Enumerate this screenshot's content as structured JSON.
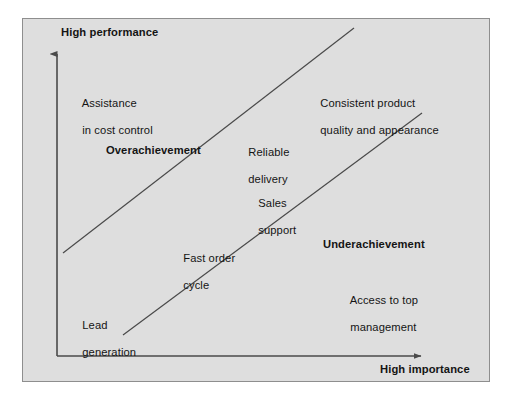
{
  "figure": {
    "type": "importance-performance-matrix",
    "background_color": "#dedede",
    "border_color": "#8e8e8e",
    "page_background": "#ffffff",
    "line_color": "#4a4a4a",
    "text_color": "#141414"
  },
  "axes": {
    "y_axis": {
      "title": "High performance",
      "direction": "up",
      "arrow": true
    },
    "x_axis": {
      "title": "High importance",
      "direction": "right",
      "arrow": true
    }
  },
  "zones": [
    {
      "label": "Overachievement",
      "emphasis": "bold"
    },
    {
      "label": "Underachievement",
      "emphasis": "bold"
    }
  ],
  "attributes": [
    {
      "label": "Assistance\nin cost control",
      "line1": "Assistance",
      "line2": "in cost control"
    },
    {
      "label": "Consistent product\nquality and appearance",
      "line1": "Consistent product",
      "line2": "quality and appearance"
    },
    {
      "label": "Reliable\ndelivery",
      "line1": "Reliable",
      "line2": "delivery"
    },
    {
      "label": "Sales\nsupport",
      "line1": "Sales",
      "line2": "support"
    },
    {
      "label": "Fast order\ncycle",
      "line1": "Fast order",
      "line2": "cycle"
    },
    {
      "label": "Access to top\nmanagement",
      "line1": "Access to top",
      "line2": "management"
    },
    {
      "label": "Lead\ngeneration",
      "line1": "Lead",
      "line2": "generation"
    }
  ],
  "diagonals": [
    {
      "name": "upper-boundary-line"
    },
    {
      "name": "lower-boundary-line"
    }
  ]
}
